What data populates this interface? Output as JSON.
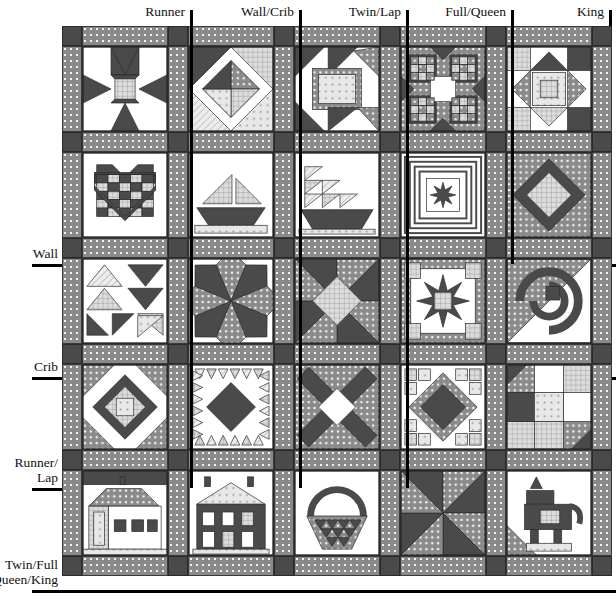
{
  "figure": {
    "kind": "quilt-size-block-chart"
  },
  "columns": {
    "labels": [
      "Runner",
      "Wall/Crib",
      "Twin/Lap",
      "Full/Queen",
      "King"
    ],
    "tick_x": [
      191,
      300,
      407,
      512,
      610
    ]
  },
  "rows": {
    "labels": [
      "Wall",
      "Crib",
      "Runner/\nLap",
      "Twin/Full\nQueen/King"
    ],
    "label_lines": [
      [
        "Wall"
      ],
      [
        "Crib"
      ],
      [
        "Runner/",
        "Lap"
      ],
      [
        "Twin/Full",
        "Queen/King"
      ]
    ],
    "rule_y": [
      264,
      377,
      488,
      590
    ]
  },
  "palette": {
    "dark": "#4a4a4a",
    "dotted_sash": "#8a8a8a",
    "dot": "#f2f2f2",
    "white": "#ffffff",
    "light_grid": "#d9d9d9",
    "mid": "#a8a8a8",
    "outline": "#2a2a2a"
  },
  "grid": {
    "cols": 5,
    "rows": 5,
    "sash_px": 20,
    "block_px": 86,
    "origin_x": 62,
    "origin_y": 26,
    "width": 548,
    "height": 564
  },
  "blocks": [
    [
      {
        "name": "ohio-star-variation",
        "pattern": "sawtooth-star"
      },
      {
        "name": "card-trick-pinwheel",
        "pattern": "card-trick"
      },
      {
        "name": "corner-square-framed",
        "pattern": "framed-square"
      },
      {
        "name": "bear-paw-cross",
        "pattern": "bear-paw"
      },
      {
        "name": "nine-patch-star",
        "pattern": "nine-patch-star"
      }
    ],
    [
      {
        "name": "checkerboard-heart",
        "pattern": "heart"
      },
      {
        "name": "sailboat",
        "pattern": "sailboat"
      },
      {
        "name": "tall-ship",
        "pattern": "ship"
      },
      {
        "name": "log-cabin-star",
        "pattern": "framed-star"
      },
      {
        "name": "on-point-diamond",
        "pattern": "diamond-in-square"
      }
    ],
    [
      {
        "name": "flying-geese-fan",
        "pattern": "flying-geese"
      },
      {
        "name": "eight-point-star",
        "pattern": "lemoyne-star"
      },
      {
        "name": "pinwheel-star",
        "pattern": "pinwheel-star"
      },
      {
        "name": "sawtooth-medallion",
        "pattern": "medallion-star"
      },
      {
        "name": "snail-trail",
        "pattern": "snail-trail"
      }
    ],
    [
      {
        "name": "square-in-square-star",
        "pattern": "square-in-square"
      },
      {
        "name": "feathered-diamond",
        "pattern": "feathered-star"
      },
      {
        "name": "double-x-cross",
        "pattern": "x-cross"
      },
      {
        "name": "diamond-medallion",
        "pattern": "diamond-medallion"
      },
      {
        "name": "four-patch-scrappy",
        "pattern": "four-patch"
      }
    ],
    [
      {
        "name": "schoolhouse",
        "pattern": "schoolhouse"
      },
      {
        "name": "two-story-house",
        "pattern": "house"
      },
      {
        "name": "flower-basket",
        "pattern": "basket"
      },
      {
        "name": "dutch-pinwheel-star",
        "pattern": "pinwheel"
      },
      {
        "name": "scottie-dog",
        "pattern": "dog"
      }
    ]
  ]
}
